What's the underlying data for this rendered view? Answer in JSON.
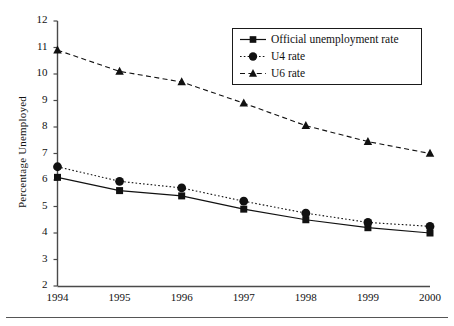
{
  "figure": {
    "background_color": "#ffffff",
    "line_color": "#1a1a1a",
    "bottom_rule": true
  },
  "axes": {
    "y_title": "Percentage Unemployed",
    "x_title": "",
    "y_ticks": [
      "12",
      "11",
      "10",
      "9",
      "8",
      "7",
      "6",
      "5",
      "4",
      "3",
      "2"
    ],
    "x_ticks": [
      "1994",
      "1995",
      "1996",
      "1997",
      "1998",
      "1999",
      "2000"
    ]
  },
  "legend": {
    "items": [
      {
        "label": "Official unemployment rate",
        "marker": "square",
        "line_style": "solid"
      },
      {
        "label": "U4 rate",
        "marker": "circle",
        "line_style": "dotted"
      },
      {
        "label": "U6 rate",
        "marker": "triangle",
        "line_style": "dashed"
      }
    ]
  },
  "chart_data": {
    "type": "line",
    "title": "",
    "xlabel": "",
    "ylabel": "Percentage Unemployed",
    "x": [
      1994,
      1995,
      1996,
      1997,
      1998,
      1999,
      2000
    ],
    "categories": [
      "1994",
      "1995",
      "1996",
      "1997",
      "1998",
      "1999",
      "2000"
    ],
    "xlim": [
      1994,
      2000
    ],
    "ylim": [
      2,
      12
    ],
    "y_tick_step": 1,
    "grid": false,
    "legend_position": "top-right",
    "series": [
      {
        "name": "Official unemployment rate",
        "marker": "square",
        "line_style": "solid",
        "color": "#111111",
        "values": [
          6.1,
          5.6,
          5.4,
          4.9,
          4.5,
          4.2,
          4.0
        ]
      },
      {
        "name": "U4 rate",
        "marker": "circle",
        "line_style": "dotted",
        "color": "#111111",
        "values": [
          6.5,
          5.95,
          5.7,
          5.2,
          4.75,
          4.4,
          4.25
        ]
      },
      {
        "name": "U6 rate",
        "marker": "triangle",
        "line_style": "dashed",
        "color": "#111111",
        "values": [
          10.9,
          10.1,
          9.7,
          8.9,
          8.05,
          7.45,
          7.0
        ]
      }
    ]
  }
}
